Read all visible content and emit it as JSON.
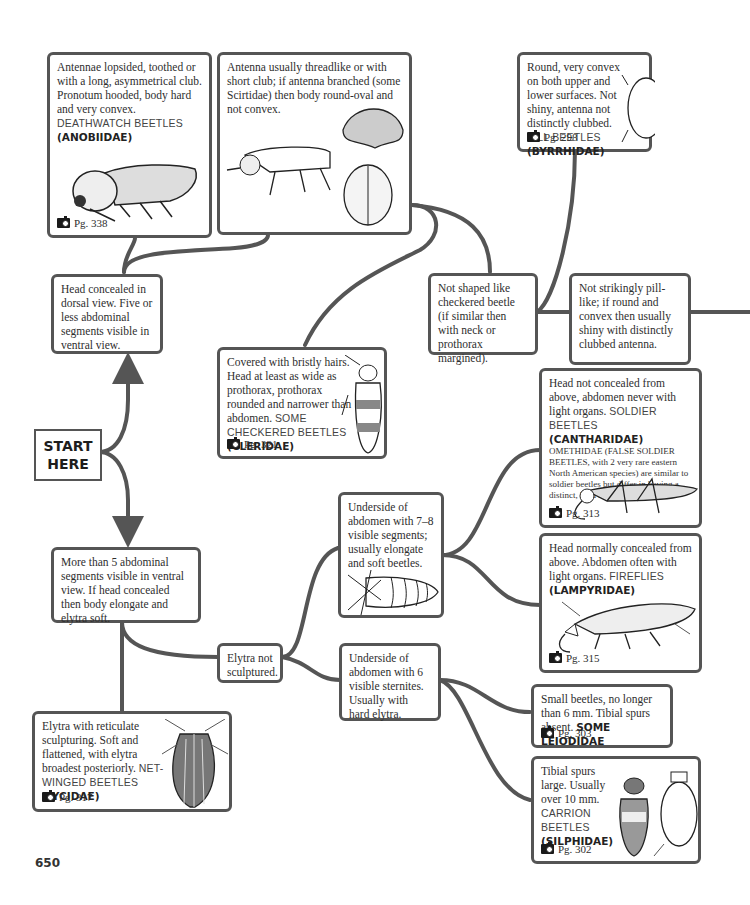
{
  "page": {
    "number": "650"
  },
  "start": {
    "line1": "START",
    "line2": "HERE"
  },
  "nodes": {
    "anobiidae": {
      "text": "Antennae lopsided, toothed or with a long, asymmetrical club. Pronotum hooded, body hard and very convex.",
      "common": "DEATHWATCH BEETLES",
      "family": "(ANOBIIDAE)",
      "page_ref": "Pg. 338",
      "illustration": "deathwatch-beetle-side-view"
    },
    "threadlike": {
      "text": "Antenna usually threadlike or with short club; if antenna branched (some Scirtidae) then body round-oval and not convex.",
      "illustration": "three-beetle-sketches"
    },
    "byrrhidae": {
      "text": "Round, very convex on both upper and lower surfaces. Not shiny, antenna not distinctly clubbed.",
      "common": "PILL BEETLES",
      "family": "(BYRRHIDAE)",
      "page_ref": "Pg. 298",
      "illustration": "pill-beetle-dorsal"
    },
    "head_concealed": {
      "text": "Head concealed in dorsal view. Five or less abdominal segments visible in ventral view."
    },
    "not_checkered": {
      "text": "Not shaped like checkered beetle (if similar then with neck or prothorax margined)."
    },
    "not_pill": {
      "text": "Not strikingly pill-like; if round and convex then usually shiny with distinctly clubbed antenna."
    },
    "cleridae": {
      "text": "Covered with bristly hairs. Head at least as wide as prothorax, prothorax rounded and narrower than abdomen.",
      "common": "SOME CHECKERED BEETLES",
      "family": "(CLERIDAE)",
      "page_ref": "Pg. 321",
      "illustration": "checkered-beetle-dorsal"
    },
    "cantharidae": {
      "text": "Head not concealed from above, abdomen never with light organs.",
      "common": "SOLDIER BEETLES",
      "family": "(CANTHARIDAE)",
      "note": "OMETHIDAE (FALSE SOLDIER BEETLES, with 2 very rare eastern North American species) are similar to soldier beetles but differ in having a distinct, hard labrum.",
      "page_ref": "Pg. 313",
      "illustration": "soldier-beetle-side"
    },
    "lampyridae": {
      "text": "Head normally concealed from above. Abdomen often with light organs.",
      "common": "FIREFLIES",
      "family": "(LAMPYRIDAE)",
      "page_ref": "Pg. 315",
      "illustration": "firefly-side"
    },
    "more_than_5": {
      "text": "More than 5 abdominal segments visible in ventral view. If head concealed then body elongate and elytra soft."
    },
    "seven_eight": {
      "text": "Underside of abdomen with 7–8 visible segments; usually elongate and soft beetles.",
      "illustration": "abdomen-underside"
    },
    "elytra_not": {
      "text": "Elytra not sculptured."
    },
    "six_sternites": {
      "text": "Underside of abdomen with 6 visible sternites. Usually with hard elytra."
    },
    "lycidae": {
      "text": "Elytra with reticulate sculpturing. Soft and flattened, with elytra broadest posteriorly.",
      "common": "NET-WINGED BEETLES",
      "family": "(LYCIDAE)",
      "page_ref": "Pg. 317",
      "illustration": "net-winged-beetle-dorsal"
    },
    "leiodidae": {
      "text": "Small beetles, no longer than 6 mm. Tibial spurs absent.",
      "family": "SOME LEIODIDAE",
      "page_ref": "Pg. 303"
    },
    "silphidae": {
      "text": "Tibial spurs large. Usually over 10 mm.",
      "common": "CARRION BEETLES",
      "family": "(SILPHIDAE)",
      "page_ref": "Pg. 302",
      "illustration": "carrion-beetles-dorsal"
    }
  },
  "colors": {
    "connector": "#555555",
    "border": "#555555",
    "text": "#2e2e2e"
  }
}
